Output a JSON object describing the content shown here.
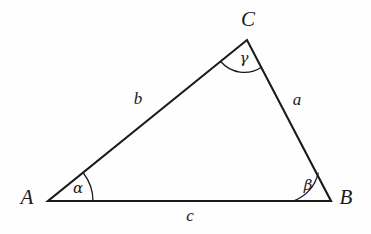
{
  "figure": {
    "kind": "geometry-diagram",
    "background_color": "#fefefe",
    "stroke_color": "#1a1a1a",
    "text_color": "#1a1a1a"
  },
  "vertices": [
    {
      "id": "A",
      "label": "A",
      "x": 48,
      "y": 201,
      "label_x": 27,
      "label_y": 197
    },
    {
      "id": "B",
      "label": "B",
      "x": 331,
      "y": 201,
      "label_x": 346,
      "label_y": 197
    },
    {
      "id": "C",
      "label": "C",
      "x": 247,
      "y": 40,
      "label_x": 248,
      "label_y": 19
    }
  ],
  "sides": [
    {
      "id": "a",
      "label": "a",
      "from": "C",
      "to": "B",
      "label_x": 297,
      "label_y": 99
    },
    {
      "id": "b",
      "label": "b",
      "from": "A",
      "to": "C",
      "label_x": 138,
      "label_y": 98
    },
    {
      "id": "c",
      "label": "c",
      "from": "A",
      "to": "B",
      "label_x": 190,
      "label_y": 215
    }
  ],
  "angles": [
    {
      "id": "alpha",
      "label": "α",
      "at_vertex": "A",
      "label_x": 78,
      "label_y": 188,
      "arc_radius": 45
    },
    {
      "id": "beta",
      "label": "β",
      "at_vertex": "B",
      "label_x": 308,
      "label_y": 185,
      "arc_radius": 38
    },
    {
      "id": "gamma",
      "label": "γ",
      "at_vertex": "C",
      "label_x": 244,
      "label_y": 58,
      "arc_radius": 31
    }
  ],
  "geometry": {
    "triangle_path": "M 48 201 L 331 201 L 247 40 Z",
    "arc_alpha_path": "M 93 201 A 45 45 0 0 0 83.7 173.5",
    "arc_beta_path": "M 293 201 A 38 38 0 0 0 318.1 173.1",
    "arc_gamma_path": "M 220.7 61.5 A 31 31 0 0 0 261.5 67.2",
    "stroke_width": 2.1,
    "arc_stroke_width": 1.3
  }
}
